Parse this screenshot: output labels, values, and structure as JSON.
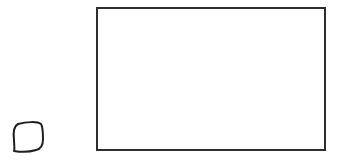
{
  "canvas": {
    "width": 341,
    "height": 163,
    "background": "#ffffff"
  },
  "shapes": {
    "large_rectangle": {
      "label": "",
      "x": 97,
      "y": 8,
      "width": 228,
      "height": 142,
      "stroke": "#2e2e2e",
      "stroke_width": 2
    },
    "small_sketch_square": {
      "label": "",
      "stroke": "#1f1f1f",
      "stroke_width": 2
    }
  }
}
